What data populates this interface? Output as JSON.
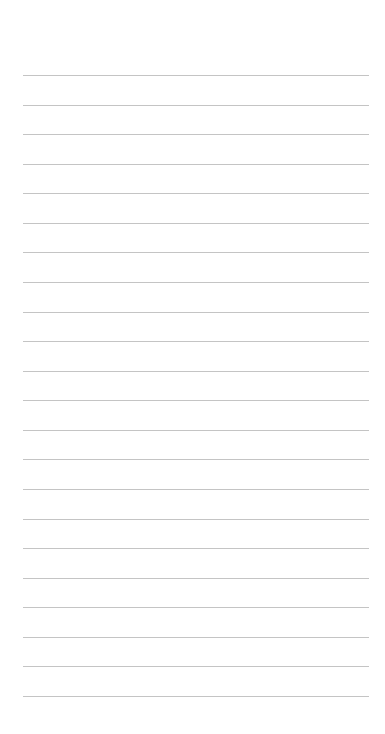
{
  "page": {
    "type": "lined-paper",
    "background_color": "#ffffff",
    "line_color": "#c4c4c4",
    "line_count": 22,
    "first_line_y": 75,
    "last_line_y": 696,
    "line_left_x": 23,
    "line_right_x": 369
  }
}
